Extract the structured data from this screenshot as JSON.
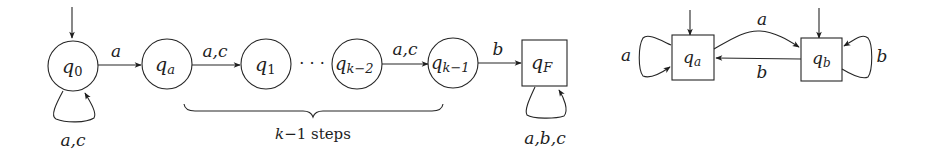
{
  "diagram": {
    "left_automaton": {
      "states": [
        {
          "id": "q0",
          "base": "q",
          "sub": "0",
          "shape": "circle",
          "initial": true
        },
        {
          "id": "qa",
          "base": "q",
          "sub": "a",
          "shape": "circle"
        },
        {
          "id": "q1",
          "base": "q",
          "sub": "1",
          "shape": "circle"
        },
        {
          "id": "qk2",
          "base": "q",
          "sub": "k−2",
          "shape": "circle"
        },
        {
          "id": "qk1",
          "base": "q",
          "sub": "k−1",
          "shape": "circle"
        },
        {
          "id": "qF",
          "base": "q",
          "sub": "F",
          "shape": "square"
        }
      ],
      "transitions": [
        {
          "from": "q0",
          "to": "q0",
          "label": "a,c"
        },
        {
          "from": "q0",
          "to": "qa",
          "label": "a"
        },
        {
          "from": "qa",
          "to": "q1",
          "label": "a,c"
        },
        {
          "from": "qk2",
          "to": "qk1",
          "label": "a,c"
        },
        {
          "from": "qk1",
          "to": "qF",
          "label": "b"
        },
        {
          "from": "qF",
          "to": "qF",
          "label": "a,b,c"
        }
      ],
      "ellipsis": "· · ·",
      "brace_label_var": "k",
      "brace_label_rest": "−1 steps"
    },
    "right_automaton": {
      "states": [
        {
          "id": "qa",
          "base": "q",
          "sub": "a",
          "shape": "square",
          "initial": true
        },
        {
          "id": "qb",
          "base": "q",
          "sub": "b",
          "shape": "square",
          "initial": true
        }
      ],
      "transitions": [
        {
          "from": "qa",
          "to": "qa",
          "label": "a"
        },
        {
          "from": "qa",
          "to": "qb",
          "label": "a"
        },
        {
          "from": "qb",
          "to": "qa",
          "label": "b"
        },
        {
          "from": "qb",
          "to": "qb",
          "label": "b"
        }
      ]
    }
  }
}
